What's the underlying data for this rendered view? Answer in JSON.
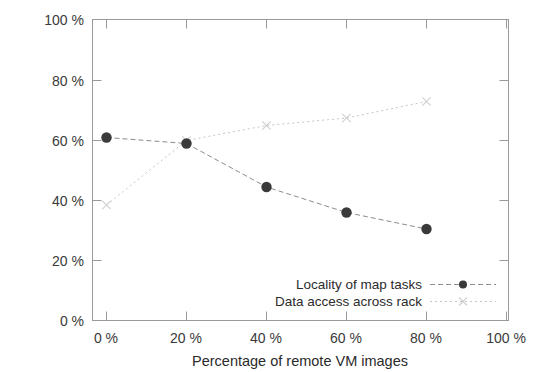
{
  "chart_data": {
    "type": "line",
    "title": "",
    "xlabel": "Percentage of remote VM images",
    "ylabel": "",
    "x": [
      0,
      20,
      40,
      60,
      80
    ],
    "xlim": [
      0,
      100
    ],
    "ylim": [
      0,
      100
    ],
    "grid": false,
    "legend_position": "bottom-right inside plot",
    "xticks": [
      "0 %",
      "20 %",
      "40 %",
      "60 %",
      "80 %",
      "100 %"
    ],
    "xtick_values": [
      0,
      20,
      40,
      60,
      80,
      100
    ],
    "yticks": [
      "0 %",
      "20 %",
      "40 %",
      "60 %",
      "80 %",
      "100 %"
    ],
    "ytick_values": [
      0,
      20,
      40,
      60,
      80,
      100
    ],
    "series": [
      {
        "name": "Locality of map tasks",
        "values": [
          61,
          59,
          44.5,
          36,
          30.5
        ],
        "marker": "filled-circle",
        "line_style": "dashed",
        "color": "#3a3a3a"
      },
      {
        "name": "Data access across rack",
        "values": [
          38.5,
          60,
          65,
          67.5,
          73
        ],
        "marker": "x-cross",
        "line_style": "dotted",
        "color": "#c6c6c6"
      }
    ]
  },
  "legend": {
    "entries": [
      {
        "label": "Locality of map tasks"
      },
      {
        "label": "Data access across rack"
      }
    ]
  },
  "axes": {
    "x_title": "Percentage of remote VM images"
  }
}
